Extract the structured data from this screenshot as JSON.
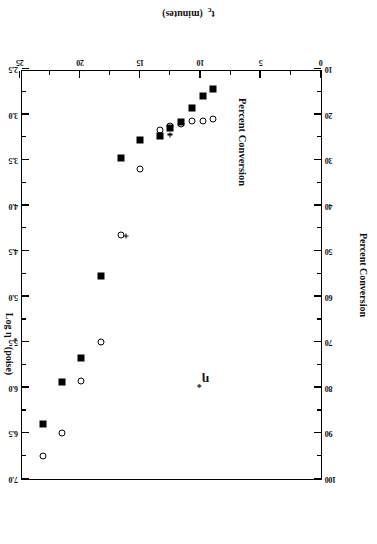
{
  "figure": {
    "rotation_note": "scan is printed upside down",
    "background_color": "#ffffff",
    "ink_color": "#000000"
  },
  "axes": {
    "left": {
      "title": "Percent Conversion",
      "ticks": [
        10,
        20,
        30,
        40,
        50,
        60,
        70,
        80,
        90,
        100
      ],
      "min": 10,
      "max": 100
    },
    "bottom": {
      "title_main": "t",
      "title_sub": "c",
      "title_unit": "(minutes)",
      "title": "t_c  (minutes)",
      "ticks": [
        0,
        5,
        10,
        15,
        20,
        25
      ],
      "min": 0,
      "max": 25
    },
    "right": {
      "title_main": "Log η",
      "title_sup": "*",
      "title_unit": "(poise)",
      "title": "Log η*  (poise)",
      "ticks": [
        2.5,
        3.0,
        3.5,
        4.0,
        4.5,
        5.0,
        5.5,
        6.0,
        6.5,
        7.0
      ],
      "min": 2.5,
      "max": 7.0
    }
  },
  "annotations": [
    {
      "name": "eta-star-label",
      "text_main": "η",
      "text_sup": "*",
      "text": "η*",
      "tc": 9.8,
      "logeta": 5.92
    },
    {
      "name": "percent-conversion-label",
      "text": "Percent Conversion",
      "tc": 6.6,
      "conversion": 26.0
    }
  ],
  "chart_data": {
    "type": "scatter",
    "title": "",
    "xlabel": "t_c  (minutes)",
    "ylabel": "Percent Conversion",
    "y2label": "Log η*  (poise)",
    "xlim": [
      0,
      25
    ],
    "ylim": [
      10,
      100
    ],
    "y2lim": [
      2.5,
      7.0
    ],
    "grid": false,
    "legend": "none (in-plot text annotations)",
    "x_ticks": [
      0,
      5,
      10,
      15,
      20,
      25
    ],
    "y_ticks": [
      10,
      20,
      30,
      40,
      50,
      60,
      70,
      80,
      90,
      100
    ],
    "y2_ticks": [
      2.5,
      3.0,
      3.5,
      4.0,
      4.5,
      5.0,
      5.5,
      6.0,
      6.5,
      7.0
    ],
    "series": [
      {
        "name": "Percent Conversion",
        "marker": "open-circle",
        "axis": "left",
        "x": [
          9.0,
          9.8,
          10.7,
          11.6,
          12.5,
          13.4,
          15.0,
          16.6,
          18.3,
          19.9,
          21.5,
          23.1
        ],
        "y": [
          21.0,
          21.5,
          21.5,
          22.0,
          22.5,
          23.5,
          32.0,
          46.5,
          70.0,
          78.5,
          90.0,
          95.0
        ]
      },
      {
        "name": "Log η*",
        "marker": "filled-square",
        "axis": "right",
        "x": [
          9.0,
          9.8,
          10.7,
          11.6,
          12.5,
          13.4,
          15.0,
          16.6,
          18.3,
          19.9,
          21.5,
          23.1
        ],
        "y": [
          2.72,
          2.8,
          2.93,
          3.08,
          3.15,
          3.24,
          3.28,
          3.48,
          4.77,
          5.67,
          5.93,
          6.4
        ]
      },
      {
        "name": "gel-point-markers",
        "marker": "plus",
        "axis": "right",
        "x": [
          12.5,
          16.2
        ],
        "y": [
          3.22,
          4.33
        ]
      }
    ]
  }
}
